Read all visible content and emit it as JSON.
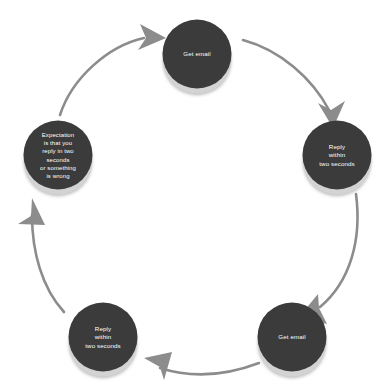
{
  "diagram": {
    "type": "cycle",
    "title": "",
    "background_color": "#ffffff",
    "node_fill_color": "#3b3b3b",
    "node_base_color": "#d3d3d3",
    "node_text_color": "#ffffff",
    "arrow_color": "#8c8c8c",
    "direction": "clockwise",
    "nodes": [
      {
        "id": "node-top",
        "label": "Get email",
        "position": "top",
        "cx": 197,
        "cy": 54
      },
      {
        "id": "node-right",
        "label": "Reply\nwithin\ntwo seconds",
        "position": "right",
        "cx": 337,
        "cy": 155
      },
      {
        "id": "node-bottom-right",
        "label": "Get email",
        "position": "bottom-right",
        "cx": 292,
        "cy": 337
      },
      {
        "id": "node-bottom-left",
        "label": "Reply\nwithin\ntwo seconds",
        "position": "bottom-left",
        "cx": 103,
        "cy": 337
      },
      {
        "id": "node-left",
        "label": "Expectation\nis that you\nreply in two\nseconds\nor something\nis wrong",
        "position": "left",
        "cx": 58,
        "cy": 155
      }
    ],
    "connectors": [
      {
        "id": "arrow-left-to-top",
        "from": "node-left",
        "to": "node-top"
      },
      {
        "id": "arrow-top-to-right",
        "from": "node-top",
        "to": "node-right"
      },
      {
        "id": "arrow-right-to-bottom-right",
        "from": "node-right",
        "to": "node-bottom-right"
      },
      {
        "id": "arrow-bottom-right-to-bottom-left",
        "from": "node-bottom-right",
        "to": "node-bottom-left"
      },
      {
        "id": "arrow-bottom-left-to-left",
        "from": "node-bottom-left",
        "to": "node-left"
      }
    ]
  }
}
